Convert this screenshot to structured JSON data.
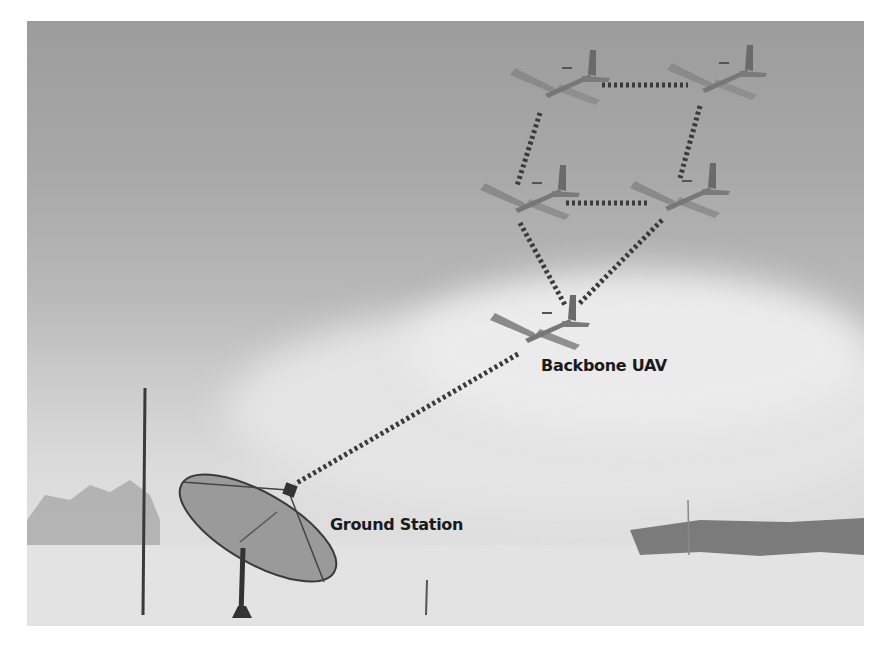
{
  "figure": {
    "labels": {
      "backbone": "Backbone UAV",
      "ground": "Ground Station"
    },
    "nodes": [
      {
        "id": "uav-top-left",
        "x": 560,
        "y": 80
      },
      {
        "id": "uav-top-right",
        "x": 720,
        "y": 75
      },
      {
        "id": "uav-mid-left",
        "x": 530,
        "y": 195
      },
      {
        "id": "uav-mid-right",
        "x": 680,
        "y": 195
      },
      {
        "id": "uav-backbone",
        "x": 545,
        "y": 325
      },
      {
        "id": "ground-station",
        "x": 290,
        "y": 490
      }
    ],
    "links": [
      [
        "uav-top-left",
        "uav-top-right"
      ],
      [
        "uav-top-left",
        "uav-mid-left"
      ],
      [
        "uav-top-right",
        "uav-mid-right"
      ],
      [
        "uav-mid-left",
        "uav-mid-right"
      ],
      [
        "uav-mid-left",
        "uav-backbone"
      ],
      [
        "uav-mid-right",
        "uav-backbone"
      ],
      [
        "uav-backbone",
        "ground-station"
      ]
    ],
    "colors": {
      "link": "#3a3a3a",
      "sky_top": "#9c9c9c",
      "ground": "#e2e2e2",
      "label": "#1a1a1a"
    }
  }
}
